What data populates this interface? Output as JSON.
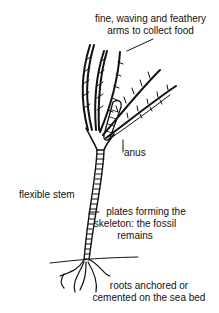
{
  "diagram": {
    "labels": {
      "arms_line1": "fine, waving and feathery",
      "arms_line2": "arms to collect food",
      "anus": "anus",
      "stem": "flexible stem",
      "plates_line1": "plates forming the",
      "plates_line2": "skeleton: the fossil",
      "plates_line3": "remains",
      "roots_line1": "roots anchored or",
      "roots_line2": "cemented on the sea bed"
    },
    "colors": {
      "ink": "#111111",
      "background": "#ffffff"
    }
  }
}
